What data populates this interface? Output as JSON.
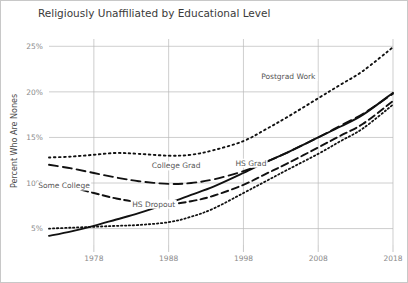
{
  "chart_data": {
    "type": "line",
    "title": "Religiously Unaffiliated by Educational Level",
    "xlabel": "",
    "ylabel": "Percent Who Are Nones",
    "xlim": [
      1972,
      2018
    ],
    "ylim": [
      3.2,
      25.8
    ],
    "grid": true,
    "legend_position": "inline-labels",
    "x_ticks": [
      1978,
      1988,
      1998,
      2008,
      2018
    ],
    "x_tick_labels": [
      "1978",
      "1988",
      "1998",
      "2008",
      "2018"
    ],
    "y_ticks": [
      5,
      10,
      15,
      20,
      25
    ],
    "y_tick_labels": [
      "5%",
      "10%",
      "15%",
      "20%",
      "25%"
    ],
    "x": [
      1972,
      1975,
      1978,
      1981,
      1984,
      1988,
      1991,
      1994,
      1998,
      2001,
      2004,
      2008,
      2011,
      2014,
      2018
    ],
    "series": [
      {
        "name": "Postgrad Work",
        "label": "Postgrad Work",
        "dash_style": "dotted",
        "label_x": 2004,
        "label_y": 21.4,
        "values": [
          12.8,
          12.9,
          13.1,
          13.3,
          13.2,
          13.0,
          13.1,
          13.6,
          14.6,
          15.9,
          17.3,
          19.3,
          20.8,
          22.3,
          24.9
        ]
      },
      {
        "name": "College Grad",
        "label": "College Grad",
        "dash_style": "dashed-long",
        "label_x": 1989,
        "label_y": 11.6,
        "values": [
          12.0,
          11.6,
          11.1,
          10.6,
          10.2,
          9.9,
          10.0,
          10.4,
          11.3,
          12.3,
          13.4,
          15.0,
          16.3,
          17.6,
          19.8
        ]
      },
      {
        "name": "Some College",
        "label": "Some College",
        "dash_style": "dashed-med",
        "label_x": 1974,
        "label_y": 9.4,
        "values": [
          10.0,
          9.5,
          8.9,
          8.3,
          7.9,
          7.7,
          8.0,
          8.6,
          9.8,
          11.0,
          12.2,
          13.9,
          15.2,
          16.5,
          19.0
        ]
      },
      {
        "name": "HS Grad",
        "label": "HS Grad",
        "dash_style": "dotted-fine",
        "label_x": 1999,
        "label_y": 11.9,
        "values": [
          5.0,
          5.1,
          5.2,
          5.3,
          5.4,
          5.7,
          6.3,
          7.2,
          8.9,
          10.2,
          11.5,
          13.2,
          14.6,
          16.0,
          18.6
        ]
      },
      {
        "name": "HS Dropout",
        "label": "HS Dropout",
        "dash_style": "solid",
        "label_x": 1986,
        "label_y": 7.4,
        "values": [
          4.2,
          4.7,
          5.3,
          6.0,
          6.7,
          7.8,
          8.7,
          9.6,
          11.1,
          12.3,
          13.4,
          15.0,
          16.2,
          17.5,
          19.9
        ]
      }
    ]
  }
}
